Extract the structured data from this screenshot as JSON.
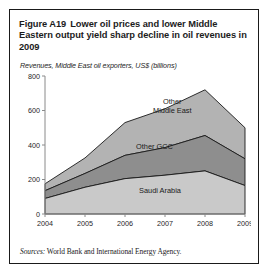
{
  "figure": {
    "number": "Figure A19",
    "title": "Lower oil prices and lower Middle Eastern output yield sharp decline in oil revenues in 2009",
    "source_label": "Sources:",
    "source_text": "World Bank and International Energy Agency."
  },
  "colors": {
    "saudi_arabia": "#c9c9c9",
    "other_gcc": "#8e8e8e",
    "other_middle_east": "#b3b3b3",
    "outline": "#1a1a1a",
    "axis": "#8a8a8a",
    "text": "#1a1a1a"
  },
  "chart_data": {
    "type": "area",
    "stacked": true,
    "title": "Lower oil prices and lower Middle Eastern output yield sharp decline in oil revenues in 2009",
    "subtitle": "Revenues, Middle East oil exporters, US$ (billions)",
    "xlabel": "",
    "ylabel": "",
    "x": [
      "2004",
      "2005",
      "2006",
      "2007",
      "2008",
      "2009"
    ],
    "xticklabels": [
      "2004",
      "2005",
      "2006",
      "2007",
      "2008",
      "2009"
    ],
    "yticklabels": [
      "0",
      "200",
      "400",
      "600",
      "800"
    ],
    "yticks": [
      0,
      200,
      400,
      600,
      800
    ],
    "ylim": [
      0,
      800
    ],
    "grid": false,
    "legend": "inline-area-labels",
    "series": [
      {
        "name": "Saudi Arabia",
        "values": [
          90,
          155,
          205,
          225,
          250,
          165
        ]
      },
      {
        "name": "Other GCC",
        "values": [
          45,
          80,
          135,
          160,
          205,
          155
        ]
      },
      {
        "name": "Other Middle East",
        "values": [
          40,
          90,
          190,
          225,
          265,
          180
        ]
      }
    ],
    "cumulative_totals": [
      175,
      325,
      530,
      610,
      720,
      500
    ]
  }
}
